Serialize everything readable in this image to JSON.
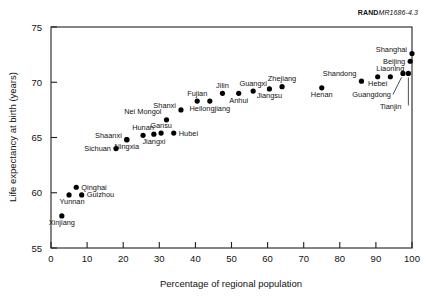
{
  "figure": {
    "report_id_bold": "RAND",
    "report_id_italic": "MR1686-4.3"
  },
  "chart_data": {
    "type": "scatter",
    "title": "",
    "xlabel": "Percentage of regional population",
    "ylabel": "Life expectancy at birth (years)",
    "xlim": [
      0,
      100
    ],
    "ylim": [
      55,
      75
    ],
    "xticks": [
      0,
      10,
      20,
      30,
      40,
      50,
      60,
      70,
      80,
      90,
      100
    ],
    "yticks": [
      55,
      60,
      65,
      70,
      75
    ],
    "grid": false,
    "legend": "none",
    "points": [
      {
        "label": "Xinjiang",
        "x": 3.0,
        "y": 57.9,
        "label_pos": "below"
      },
      {
        "label": "Yunnan",
        "x": 5.0,
        "y": 59.8,
        "label_pos": "below-left"
      },
      {
        "label": "Guizhou",
        "x": 8.5,
        "y": 59.8,
        "label_pos": "right"
      },
      {
        "label": "Qinghai",
        "x": 7.0,
        "y": 60.5,
        "label_pos": "right"
      },
      {
        "label": "Sichuan",
        "x": 18.0,
        "y": 64.0,
        "label_pos": "left"
      },
      {
        "label": "Ningxia",
        "x": 21.0,
        "y": 64.8,
        "label_pos": "below"
      },
      {
        "label": "Shaanxi",
        "x": 21.0,
        "y": 64.8,
        "label_pos": "left-up"
      },
      {
        "label": "Hunan",
        "x": 25.5,
        "y": 65.2,
        "label_pos": "above"
      },
      {
        "label": "Jiangxi",
        "x": 28.5,
        "y": 65.3,
        "label_pos": "below"
      },
      {
        "label": "Gansu",
        "x": 30.5,
        "y": 65.4,
        "label_pos": "above"
      },
      {
        "label": "Hubei",
        "x": 34.0,
        "y": 65.4,
        "label_pos": "right"
      },
      {
        "label": "Nei Mongol",
        "x": 32.0,
        "y": 66.6,
        "label_pos": "above-left"
      },
      {
        "label": "Shanxi",
        "x": 36.0,
        "y": 67.5,
        "label_pos": "left-up"
      },
      {
        "label": "Fujian",
        "x": 40.5,
        "y": 68.3,
        "label_pos": "above"
      },
      {
        "label": "Heilongjiang",
        "x": 44.0,
        "y": 68.3,
        "label_pos": "below"
      },
      {
        "label": "Jilin",
        "x": 47.5,
        "y": 69.0,
        "label_pos": "above"
      },
      {
        "label": "Anhui",
        "x": 52.0,
        "y": 69.0,
        "label_pos": "below"
      },
      {
        "label": "Guangxi",
        "x": 56.0,
        "y": 69.2,
        "label_pos": "above"
      },
      {
        "label": "Jiangsu",
        "x": 60.5,
        "y": 69.4,
        "label_pos": "below"
      },
      {
        "label": "Zhejiang",
        "x": 64.0,
        "y": 69.6,
        "label_pos": "above"
      },
      {
        "label": "Henan",
        "x": 75.0,
        "y": 69.5,
        "label_pos": "below"
      },
      {
        "label": "Shandong",
        "x": 86.0,
        "y": 70.1,
        "label_pos": "above-left"
      },
      {
        "label": "Hebei",
        "x": 90.5,
        "y": 70.5,
        "label_pos": "below"
      },
      {
        "label": "Liaoning",
        "x": 94.0,
        "y": 70.5,
        "label_pos": "above"
      },
      {
        "label": "Guangdong",
        "x": 97.5,
        "y": 70.8,
        "label_pos": "leader-left"
      },
      {
        "label": "Tianjin",
        "x": 99.0,
        "y": 70.8,
        "label_pos": "leader-down"
      },
      {
        "label": "Beijing",
        "x": 99.5,
        "y": 71.9,
        "label_pos": "left"
      },
      {
        "label": "Shanghai",
        "x": 100.0,
        "y": 72.6,
        "label_pos": "left-up"
      }
    ]
  }
}
